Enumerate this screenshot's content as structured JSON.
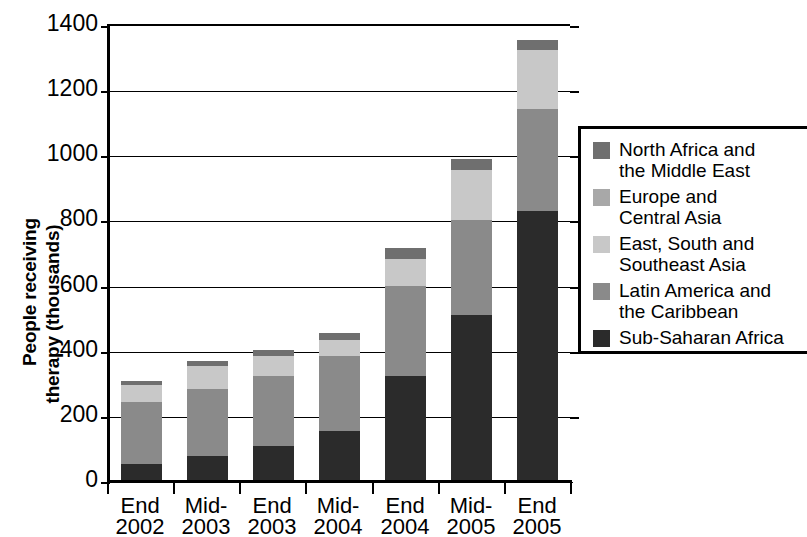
{
  "chart_data": {
    "type": "bar",
    "subtype": "stacked-bar",
    "title": "",
    "xlabel": "",
    "ylabel": "People receiving therapy (thousands)",
    "ylim": [
      0,
      1400
    ],
    "ytick_step": 200,
    "ytick_labels": [
      "1400",
      "1200",
      "1000",
      "800",
      "600",
      "400",
      "200",
      "0"
    ],
    "ytick_values": [
      1400,
      1200,
      1000,
      800,
      600,
      400,
      200,
      0
    ],
    "grid": true,
    "grid_axis": "y",
    "legend_position": "right",
    "categories": [
      "End 2002",
      "Mid-2003",
      "End 2003",
      "Mid-2004",
      "End 2004",
      "Mid-2005",
      "End 2005"
    ],
    "category_lines": [
      [
        "End",
        "2002"
      ],
      [
        "Mid-",
        "2003"
      ],
      [
        "End",
        "2003"
      ],
      [
        "Mid-",
        "2004"
      ],
      [
        "End",
        "2004"
      ],
      [
        "Mid-",
        "2005"
      ],
      [
        "End",
        "2005"
      ]
    ],
    "stack_order_bottom_to_top": [
      "Sub-Saharan Africa",
      "Latin America and the Caribbean",
      "East, South and Southeast Asia",
      "Europe and Central Asia",
      "North Africa and the Middle East"
    ],
    "series": [
      {
        "name": "Sub-Saharan Africa",
        "color": "#2b2b2b",
        "values": [
          50,
          75,
          105,
          150,
          320,
          507,
          825
        ]
      },
      {
        "name": "Latin America and the Caribbean",
        "color": "#8a8a8a",
        "values": [
          190,
          205,
          215,
          230,
          275,
          290,
          315
        ]
      },
      {
        "name": "East, South and Southeast Asia",
        "color": "#c8c8c8",
        "values": [
          52,
          70,
          60,
          50,
          85,
          155,
          180
        ]
      },
      {
        "name": "Europe and Central Asia",
        "color": "#a8a8a8",
        "values": [
          0,
          0,
          0,
          0,
          0,
          0,
          0
        ]
      },
      {
        "name": "North Africa and the Middle East",
        "color": "#6f6f6f",
        "values": [
          13,
          15,
          20,
          20,
          32,
          35,
          30
        ]
      }
    ],
    "totals": [
      305,
      365,
      400,
      450,
      712,
      987,
      1350
    ]
  },
  "axis": {
    "y_title_line1": "People receiving",
    "y_title_line2": "therapy (thousands)"
  },
  "legend": {
    "items": [
      {
        "label": "North Africa and\nthe Middle East",
        "color": "#6f6f6f",
        "name": "north-africa-middle-east"
      },
      {
        "label": "Europe and\nCentral Asia",
        "color": "#a8a8a8",
        "name": "europe-central-asia"
      },
      {
        "label": "East, South and\nSoutheast Asia",
        "color": "#c8c8c8",
        "name": "east-south-southeast-asia"
      },
      {
        "label": "Latin America and\nthe Caribbean",
        "color": "#8a8a8a",
        "name": "latin-america-caribbean"
      },
      {
        "label": "Sub-Saharan Africa",
        "color": "#2b2b2b",
        "name": "sub-saharan-africa"
      }
    ]
  }
}
